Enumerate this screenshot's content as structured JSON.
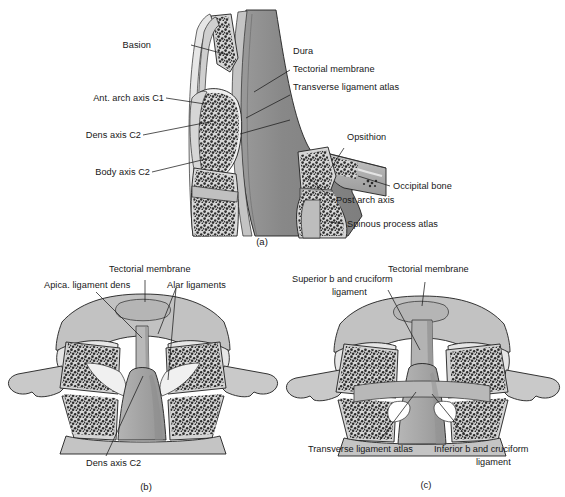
{
  "figure": {
    "panels": [
      {
        "id": "a",
        "caption": "(a)",
        "view": "midsagittal section",
        "labels": [
          {
            "key": "basion",
            "text": "Basion"
          },
          {
            "key": "ant_arch_axis_c1",
            "text": "Ant. arch axis C1"
          },
          {
            "key": "dens_axis_c2",
            "text": "Dens axis C2"
          },
          {
            "key": "body_axis_c2",
            "text": "Body axis C2"
          },
          {
            "key": "dura",
            "text": "Dura"
          },
          {
            "key": "tectorial_membrane",
            "text": "Tectorial membrane"
          },
          {
            "key": "transverse_lig",
            "text": "Transverse ligament atlas"
          },
          {
            "key": "opsithion",
            "text": "Opsithion"
          },
          {
            "key": "occipital_bone",
            "text": "Occipital bone"
          },
          {
            "key": "post_arch_axis",
            "text": "Post arch axis"
          },
          {
            "key": "spinous_process",
            "text": "Spinous process atlas"
          }
        ]
      },
      {
        "id": "b",
        "caption": "(b)",
        "view": "coronal section, alar ligaments",
        "labels": [
          {
            "key": "apical_lig_dens",
            "text": "Apica. ligament dens"
          },
          {
            "key": "tectorial_membrane",
            "text": "Tectorial membrane"
          },
          {
            "key": "alar_ligaments",
            "text": "Alar ligaments"
          },
          {
            "key": "dens_axis_c2",
            "text": "Dens axis C2"
          }
        ]
      },
      {
        "id": "c",
        "caption": "(c)",
        "view": "coronal section, cruciform ligament",
        "labels": [
          {
            "key": "superior_cruciform",
            "text_line1": "Superior b and cruciform",
            "text_line2": "ligament"
          },
          {
            "key": "tectorial_membrane",
            "text": "Tectorial membrane"
          },
          {
            "key": "transverse_lig",
            "text": "Transverse ligament atlas"
          },
          {
            "key": "inferior_cruciform",
            "text_line1": "Inferior b and cruciform",
            "text_line2": "ligament"
          }
        ]
      }
    ]
  },
  "palette": {
    "background": "#ffffff",
    "ink": "#1a1a1a",
    "dura_gray": "#8a8a8a",
    "bone_light": "#d9d9d9",
    "bone_mid": "#bdbdbd",
    "bone_pale": "#e8e8e8",
    "cartilage": "#efefef",
    "cancellous_dot": "#2b2b2b",
    "membrane_light": "#cfcfcf",
    "shadow": "#9e9e9e"
  }
}
